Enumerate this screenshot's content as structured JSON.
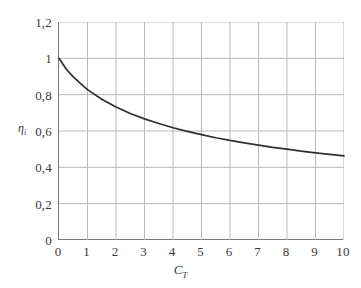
{
  "chart_data": {
    "type": "line",
    "title": "",
    "xlabel": "C_T",
    "xlabel_base": "C",
    "xlabel_sub": "T",
    "ylabel": "η_i",
    "ylabel_base": "η",
    "ylabel_sub": "i",
    "xlim": [
      0,
      10
    ],
    "ylim": [
      0,
      1.2
    ],
    "grid": true,
    "legend": null,
    "x_tick_labels": [
      "0",
      "1",
      "2",
      "3",
      "4",
      "5",
      "6",
      "7",
      "8",
      "9",
      "10"
    ],
    "x_tick_values": [
      0,
      1,
      2,
      3,
      4,
      5,
      6,
      7,
      8,
      9,
      10
    ],
    "y_tick_labels": [
      "0",
      "0,2",
      "0,4",
      "0,6",
      "0,8",
      "1",
      "1,2"
    ],
    "y_tick_values": [
      0,
      0.2,
      0.4,
      0.6,
      0.8,
      1.0,
      1.2
    ],
    "decimal_separator": ",",
    "series": [
      {
        "name": "ideal efficiency",
        "formula": "eta_i = 2 / (1 + sqrt(1 + C_T))",
        "x": [
          0,
          0.25,
          0.5,
          0.75,
          1,
          1.5,
          2,
          2.5,
          3,
          3.5,
          4,
          4.5,
          5,
          5.5,
          6,
          6.5,
          7,
          7.5,
          8,
          8.5,
          9,
          9.5,
          10
        ],
        "values": [
          1.0,
          0.941,
          0.898,
          0.862,
          0.828,
          0.775,
          0.732,
          0.696,
          0.667,
          0.641,
          0.618,
          0.598,
          0.58,
          0.563,
          0.548,
          0.535,
          0.522,
          0.51,
          0.5,
          0.489,
          0.48,
          0.471,
          0.463
        ]
      }
    ],
    "colors": {
      "curve": "#2f2f2f",
      "grid": "#b9b9b9",
      "axis": "#7a7a7a",
      "text": "#3a3a3a",
      "background": "#ffffff"
    }
  }
}
